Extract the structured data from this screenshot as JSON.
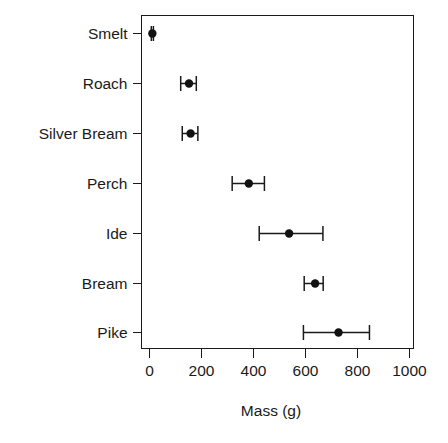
{
  "chart_data": {
    "type": "scatter",
    "title": "",
    "xlabel": "Mass (g)",
    "ylabel": "",
    "xlim": [
      -40,
      1050
    ],
    "xticks": [
      0,
      200,
      400,
      600,
      800,
      1000
    ],
    "xtick_labels": [
      "0",
      "200",
      "400",
      "600",
      "800",
      "1000"
    ],
    "categories": [
      "Smelt",
      "Roach",
      "Silver Bream",
      "Perch",
      "Ide",
      "Bream",
      "Pike"
    ],
    "grid": false,
    "legend": false,
    "error_bars": "horizontal-confidence-interval",
    "points": [
      {
        "category": "Smelt",
        "value": 11,
        "low": 7,
        "high": 15
      },
      {
        "category": "Roach",
        "value": 152,
        "low": 120,
        "high": 180
      },
      {
        "category": "Silver Bream",
        "value": 158,
        "low": 126,
        "high": 186
      },
      {
        "category": "Perch",
        "value": 382,
        "low": 318,
        "high": 442
      },
      {
        "category": "Ide",
        "value": 537,
        "low": 422,
        "high": 667
      },
      {
        "category": "Bream",
        "value": 637,
        "low": 595,
        "high": 668
      },
      {
        "category": "Pike",
        "value": 727,
        "low": 592,
        "high": 846
      }
    ]
  },
  "figure": {
    "background_color": "#ffffff",
    "ink_color": "#1a1a1a",
    "point_color": "#111111"
  }
}
